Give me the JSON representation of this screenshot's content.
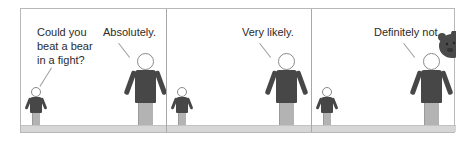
{
  "comic": {
    "panels": [
      {
        "id": 1,
        "dialogue": [
          {
            "speaker": "small-person",
            "lines": [
              "Could you",
              "beat a bear",
              "in a fight?"
            ]
          },
          {
            "speaker": "large-person",
            "lines": [
              "Absolutely."
            ]
          }
        ]
      },
      {
        "id": 2,
        "dialogue": [
          {
            "speaker": "large-person",
            "lines": [
              "Very likely."
            ]
          }
        ]
      },
      {
        "id": 3,
        "dialogue": [
          {
            "speaker": "large-person",
            "lines": [
              "Definitely not."
            ]
          }
        ],
        "extra": "bear-peeking"
      }
    ]
  },
  "colors": {
    "border": "#b8b8b8",
    "shirt": "#474747",
    "pants": "#b3b3b3",
    "floor": "#d6d6d6",
    "bear": "#4a4a4a",
    "text": "#2b2b2b"
  }
}
